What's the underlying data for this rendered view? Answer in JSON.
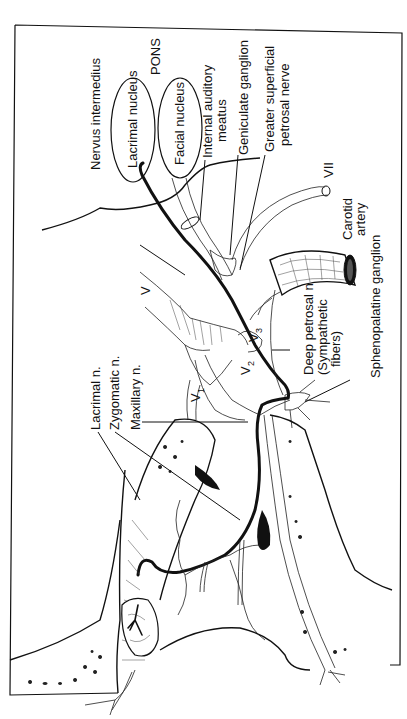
{
  "figure": {
    "orientation": "rotated-90-ccw",
    "colors": {
      "ink": "#111111",
      "paper": "#ffffff"
    }
  },
  "labels": {
    "nervus_intermedius": "Nervus intermedius",
    "pons": "PONS",
    "lacrimal_nucleus": "Lacrimal nucleus",
    "facial_nucleus": "Facial nucleus",
    "internal_auditory_meatus_1": "Internal auditory",
    "internal_auditory_meatus_2": "meatus",
    "geniculate_ganglion": "Geniculate ganglion",
    "greater_superficial_petrosal_1": "Greater superficial",
    "greater_superficial_petrosal_2": "petrosal nerve",
    "vii": "VII",
    "carotid_1": "Carotid",
    "carotid_2": "artery",
    "sphenopalatine_ganglion": "Sphenopalatine ganglion",
    "deep_petrosal_1": "Deep petrosal n",
    "deep_petrosal_2": "(Sympathetic",
    "deep_petrosal_3": "fibers)",
    "v": "V",
    "v1": "V",
    "v1_sub": "1",
    "v2": "V",
    "v2_sub": "2",
    "v3": "V",
    "v3_sub": "3",
    "lacrimal_n": "Lacrimal n.",
    "zygomatic_n": "Zygomatic n.",
    "maxillary_n": "Maxillary n."
  }
}
